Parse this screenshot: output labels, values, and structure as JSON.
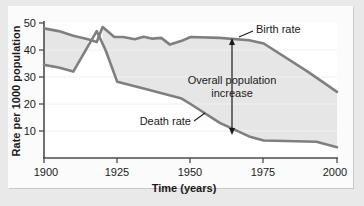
{
  "chart_data": {
    "type": "line",
    "title": "",
    "xlabel": "Time (years)",
    "ylabel": "Rate per 1000 population",
    "xlim": [
      1900,
      2000
    ],
    "ylim": [
      0,
      52
    ],
    "xticks": [
      1900,
      1925,
      1950,
      1975,
      2000
    ],
    "yticks": [
      10,
      20,
      30,
      40,
      50
    ],
    "grid": false,
    "legend_position": "inline-annotations",
    "fill_between": {
      "label": "Overall population increase",
      "upper_series": "Birth rate",
      "lower_series": "Death rate",
      "color": "#e6e6e6"
    },
    "series": [
      {
        "name": "Birth rate",
        "color": "#7f7f7f",
        "points": [
          [
            1900,
            48.0
          ],
          [
            1905,
            47.0
          ],
          [
            1910,
            45.3
          ],
          [
            1915,
            44.0
          ],
          [
            1918,
            43.0
          ],
          [
            1920,
            48.5
          ],
          [
            1924,
            44.8
          ],
          [
            1927,
            44.8
          ],
          [
            1931,
            44.0
          ],
          [
            1934,
            44.9
          ],
          [
            1937,
            44.2
          ],
          [
            1940,
            44.5
          ],
          [
            1943,
            42.0
          ],
          [
            1947,
            43.4
          ],
          [
            1950,
            44.8
          ],
          [
            1960,
            44.5
          ],
          [
            1970,
            43.6
          ],
          [
            1975,
            42.4
          ],
          [
            1990,
            32.0
          ],
          [
            2000,
            24.5
          ]
        ]
      },
      {
        "name": "Death rate",
        "color": "#7f7f7f",
        "points": [
          [
            1900,
            34.5
          ],
          [
            1905,
            33.5
          ],
          [
            1910,
            32.0
          ],
          [
            1918,
            47.0
          ],
          [
            1921,
            40.0
          ],
          [
            1925,
            28.2
          ],
          [
            1935,
            25.5
          ],
          [
            1947,
            22.0
          ],
          [
            1950,
            20.0
          ],
          [
            1960,
            13.0
          ],
          [
            1970,
            8.0
          ],
          [
            1975,
            6.5
          ],
          [
            1993,
            6.0
          ],
          [
            2000,
            4.0
          ]
        ]
      }
    ],
    "annotations": [
      {
        "name": "birth-rate-label",
        "text": "Birth rate",
        "x": 1975,
        "y": 49.5
      },
      {
        "name": "death-rate-label",
        "text": "Death rate",
        "x": 1936,
        "y": 16.5
      },
      {
        "name": "overall-increase-label",
        "line1": "Overall population",
        "line2": "increase",
        "x": 1958,
        "y": 25
      }
    ]
  },
  "axes": {
    "y_title": "Rate per 1000 population",
    "x_title": "Time (years)",
    "y_tick_labels": [
      "50",
      "40",
      "30",
      "20",
      "10"
    ],
    "x_tick_labels": [
      "1900",
      "1925",
      "1950",
      "1975",
      "2000"
    ]
  },
  "annotations": {
    "birth_rate": "Birth rate",
    "death_rate": "Death rate",
    "overall_line1": "Overall population",
    "overall_line2": "increase"
  },
  "colors": {
    "line": "#7f7f7f",
    "fill": "#e6e6e6",
    "axis": "#4d4d4d",
    "text": "#1a1a1a",
    "page_background": "#e9e9e9",
    "frame_background": "#fbfbfb",
    "plot_background": "#ffffff"
  }
}
